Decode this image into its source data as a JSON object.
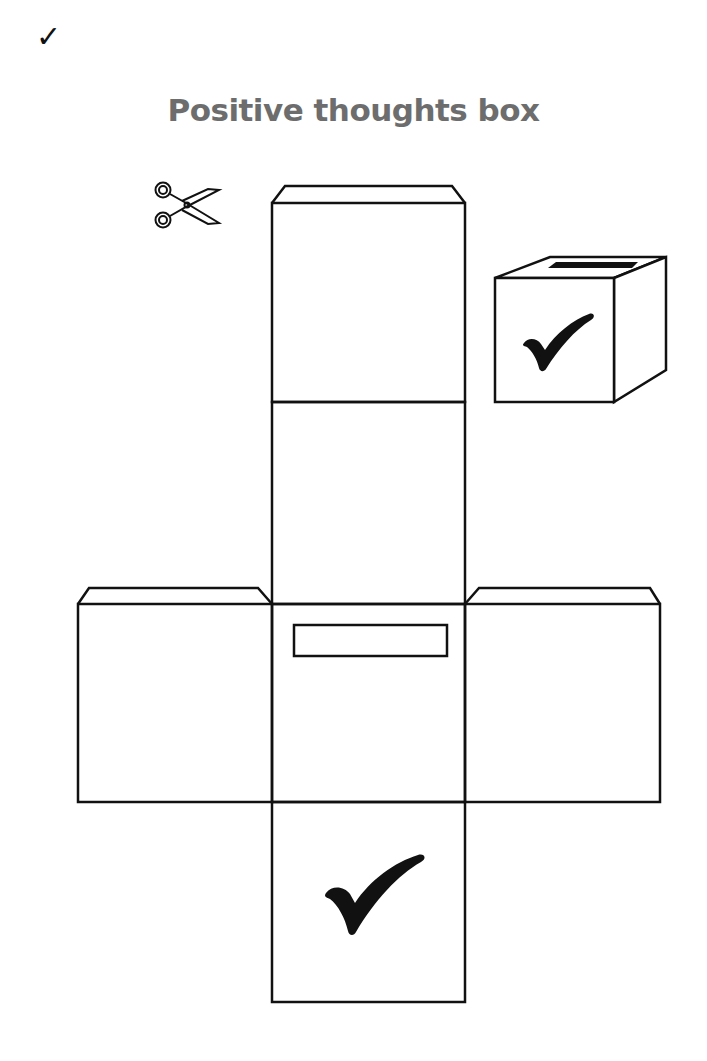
{
  "page": {
    "corner_mark": "✓",
    "title": "Positive thoughts box"
  },
  "icons": {
    "scissors": "scissors-icon",
    "ballot_box": "ballot-box-icon",
    "checkmark": "checkmark-icon"
  },
  "colors": {
    "line": "#111111",
    "title": "#6d6d6d",
    "background": "#ffffff"
  }
}
